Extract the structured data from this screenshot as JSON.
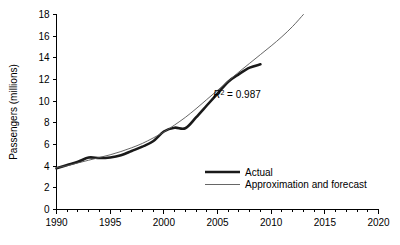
{
  "chart_data": {
    "type": "line",
    "title": "",
    "xlabel": "",
    "ylabel": "Passengers (millions)",
    "xlim": [
      1990,
      2020
    ],
    "ylim": [
      0,
      18
    ],
    "xticks": [
      1990,
      1995,
      2000,
      2005,
      2010,
      2015,
      2020
    ],
    "xticklabels": [
      "1990",
      "1995",
      "2000",
      "2005",
      "2010",
      "2015",
      "2020"
    ],
    "x_minor_tick_step": 1,
    "yticks": [
      0,
      2,
      4,
      6,
      8,
      10,
      12,
      14,
      16,
      18
    ],
    "yticklabels": [
      "0",
      "2",
      "4",
      "6",
      "8",
      "10",
      "12",
      "14",
      "16",
      "18"
    ],
    "grid": false,
    "legend_position": "center-right-lower",
    "annotations": [
      {
        "name": "r-squared",
        "text_prefix": "R",
        "text_superscript": "2",
        "text_suffix": " = 0.987",
        "full_text": "R2 = 0.987",
        "x": 2004.6,
        "y": 10.3
      }
    ],
    "series": [
      {
        "name": "Actual",
        "color": "#1a1a1a",
        "width": "thick",
        "x": [
          1990,
          1991,
          1992,
          1993,
          1994,
          1995,
          1996,
          1997,
          1998,
          1999,
          2000,
          2001,
          2002,
          2003,
          2004,
          2005,
          2006,
          2007,
          2008,
          2009
        ],
        "values": [
          3.8,
          4.1,
          4.4,
          4.8,
          4.75,
          4.8,
          5.0,
          5.4,
          5.8,
          6.3,
          7.2,
          7.55,
          7.5,
          8.5,
          9.6,
          10.7,
          11.8,
          12.5,
          13.1,
          13.4
        ]
      },
      {
        "name": "Approximation and forecast",
        "color": "#555555",
        "width": "thin",
        "x": [
          1990,
          1991,
          1992,
          1993,
          1994,
          1995,
          1996,
          1997,
          1998,
          1999,
          2000,
          2001,
          2002,
          2003,
          2004,
          2005,
          2006,
          2007,
          2008,
          2009,
          2010,
          2011,
          2012,
          2013
        ],
        "values": [
          3.85,
          4.05,
          4.3,
          4.55,
          4.8,
          5.05,
          5.35,
          5.7,
          6.1,
          6.6,
          7.15,
          7.8,
          8.5,
          9.3,
          10.15,
          11.0,
          11.85,
          12.7,
          13.5,
          14.3,
          15.1,
          15.95,
          16.9,
          18.0
        ]
      }
    ]
  },
  "legend": {
    "items": [
      {
        "label": "Actual",
        "style": "thick"
      },
      {
        "label": "Approximation and forecast",
        "style": "thin"
      }
    ]
  },
  "colors": {
    "actual": "#1a1a1a",
    "approximation": "#555555",
    "axis": "#000000",
    "background": "#ffffff"
  }
}
